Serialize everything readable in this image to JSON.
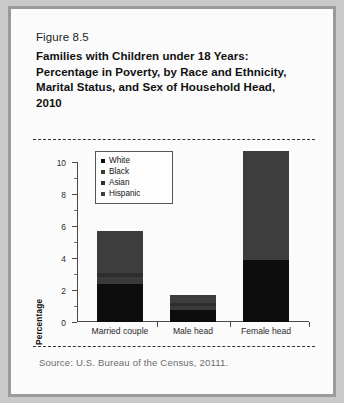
{
  "figure": {
    "number": "Figure 8.5",
    "title": "Families with Children under 18 Years: Percentage in Poverty, by Race and Ethnicity, Marital Status, and Sex of Household Head, 2010",
    "source": "Source: U.S. Bureau of the Census, 20111."
  },
  "colors": {
    "white_seg": "#0d0d0d",
    "black_seg": "#3a3a3a",
    "asian_seg": "#2e2e2e",
    "hispanic_seg": "#3d3d3d",
    "gap": "#fbfbfb",
    "axis": "#4a4a4a",
    "frame": "#9a9a9a"
  },
  "chart_data": {
    "type": "bar",
    "subtype": "stacked",
    "title": "Families with Children under 18 Years: Percentage in Poverty, by Race and Ethnicity, Marital Status, and Sex of Household Head, 2010",
    "xlabel": "",
    "ylabel": "Percentage",
    "ylim": [
      0,
      10
    ],
    "yticks": [
      0,
      2,
      4,
      6,
      8,
      10
    ],
    "yticklabels": [
      "0",
      "2",
      "4",
      "6",
      "8",
      "10"
    ],
    "minor_yticks": [
      1,
      3,
      5,
      7,
      9
    ],
    "grid": false,
    "legend": {
      "position": "upper-left-inside",
      "entries": [
        "White",
        "Black",
        "Asian",
        "Hispanic"
      ]
    },
    "categories": [
      "Married couple",
      "Male head",
      "Female head"
    ],
    "series": [
      {
        "name": "White",
        "values": [
          2.35,
          0.75,
          3.9
        ]
      },
      {
        "name": "Black",
        "values": [
          0.45,
          0.25,
          0.0
        ]
      },
      {
        "name": "Asian",
        "values": [
          0.25,
          0.2,
          0.0
        ]
      },
      {
        "name": "Hispanic",
        "values": [
          2.65,
          0.5,
          6.8
        ]
      }
    ],
    "totals": [
      5.7,
      1.7,
      10.7
    ]
  }
}
